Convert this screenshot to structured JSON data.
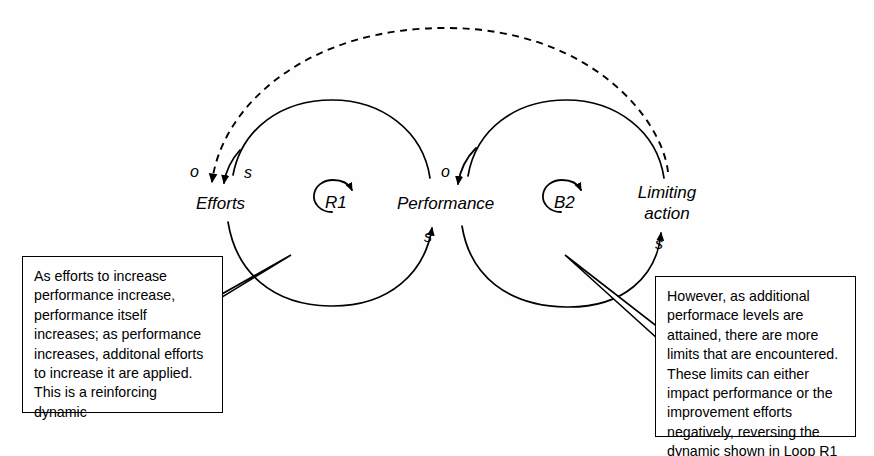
{
  "diagram": {
    "nodes": [
      {
        "id": "efforts",
        "label": "Efforts"
      },
      {
        "id": "performance",
        "label": "Performance"
      },
      {
        "id": "limiting-action",
        "label": "Limiting action",
        "line1": "Limiting",
        "line2": "action"
      }
    ],
    "loops": [
      {
        "id": "r1",
        "label": "R1",
        "type": "reinforcing",
        "direction": "clockwise"
      },
      {
        "id": "b2",
        "label": "B2",
        "type": "balancing",
        "direction": "clockwise"
      }
    ],
    "polarities": [
      {
        "id": "efforts-o",
        "label": "o",
        "target": "efforts",
        "link": "limiting-action-to-efforts",
        "style": "dashed"
      },
      {
        "id": "efforts-s",
        "label": "s",
        "target": "efforts",
        "link": "performance-to-efforts",
        "style": "solid"
      },
      {
        "id": "performance-o",
        "label": "o",
        "target": "performance",
        "link": "limiting-action-to-performance",
        "style": "solid"
      },
      {
        "id": "performance-s",
        "label": "s",
        "target": "performance",
        "link": "efforts-to-performance",
        "style": "solid"
      },
      {
        "id": "limiting-s",
        "label": "s",
        "target": "limiting-action",
        "link": "performance-to-limiting-action",
        "style": "solid"
      }
    ],
    "callouts": [
      {
        "id": "left",
        "text": "As efforts to increase performance increase, performance itself increases; as performance increases, additonal efforts to increase it are applied. This is a reinforcing dynamic"
      },
      {
        "id": "right",
        "text": "However, as additional performace levels are attained, there are more limits that are encountered. These limits can either impact performance or the improvement efforts negatively, reversing the dynamic shown in Loop R1"
      }
    ],
    "colors": {
      "stroke": "#000000",
      "background": "#fefefe",
      "callout_border": "#000000",
      "callout_fill": "#ffffff"
    }
  }
}
